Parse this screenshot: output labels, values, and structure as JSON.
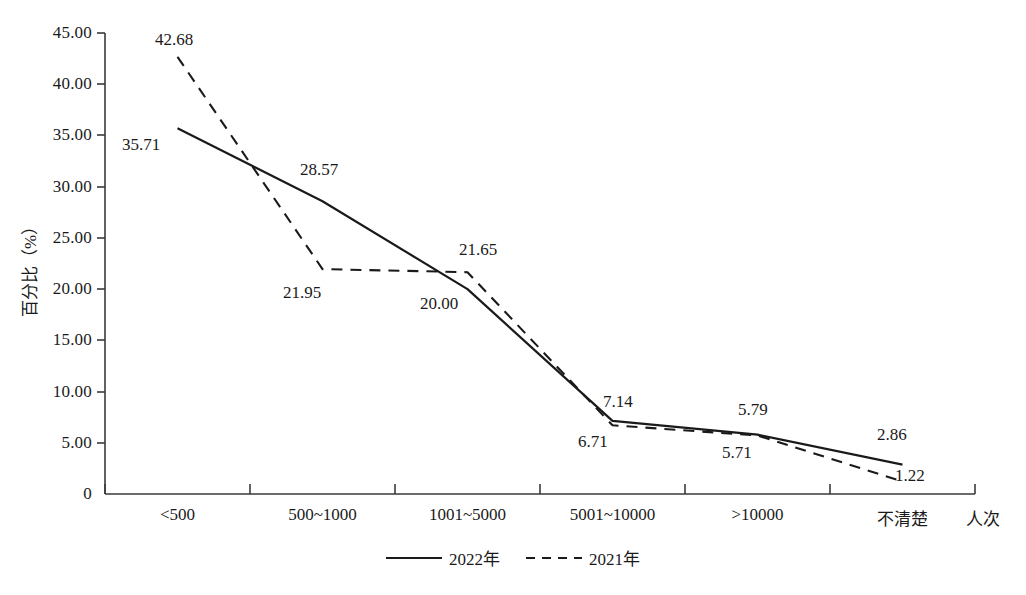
{
  "chart_data": {
    "type": "line",
    "title": "",
    "xlabel": "人次",
    "ylabel": "百分比（%）",
    "categories": [
      "<500",
      "500~1000",
      "1001~5000",
      "5001~10000",
      ">10000",
      "不清楚"
    ],
    "series": [
      {
        "name": "2022年",
        "style": "solid",
        "color": "#1a1a1a",
        "values": [
          35.71,
          28.57,
          20.0,
          7.14,
          5.79,
          2.86
        ],
        "labels": [
          "35.71",
          "28.57",
          "20.00",
          "7.14",
          "5.79",
          "2.86"
        ]
      },
      {
        "name": "2021年",
        "style": "dashed",
        "color": "#1a1a1a",
        "values": [
          42.68,
          21.95,
          21.65,
          6.71,
          5.71,
          1.22
        ],
        "labels": [
          "42.68",
          "21.95",
          "21.65",
          "6.71",
          "5.71",
          "1.22"
        ]
      }
    ],
    "ylim": [
      0,
      45
    ],
    "ytick_values": [
      0,
      5,
      10,
      15,
      20,
      25,
      30,
      35,
      40,
      45
    ],
    "ytick_labels": [
      "0",
      "5.00",
      "10.00",
      "15.00",
      "20.00",
      "25.00",
      "30.00",
      "35.00",
      "40.00",
      "45.00"
    ],
    "grid": false,
    "legend_position": "bottom-center",
    "legend": [
      "2022年",
      "2021年"
    ]
  },
  "axis": {
    "y_title": "百分比（%）",
    "x_unit": "人次"
  },
  "labels": {
    "s2022": {
      "p0": "35.71",
      "p1": "28.57",
      "p2": "20.00",
      "p3": "7.14",
      "p4": "5.79",
      "p5": "2.86"
    },
    "s2021": {
      "p0": "42.68",
      "p1": "21.95",
      "p2": "21.65",
      "p3": "6.71",
      "p4": "5.71",
      "p5": "1.22"
    }
  },
  "yticks": {
    "t0": "0",
    "t5": "5.00",
    "t10": "10.00",
    "t15": "15.00",
    "t20": "20.00",
    "t25": "25.00",
    "t30": "30.00",
    "t35": "35.00",
    "t40": "40.00",
    "t45": "45.00"
  },
  "xticks": {
    "c0": "<500",
    "c1": "500~1000",
    "c2": "1001~5000",
    "c3": "5001~10000",
    "c4": ">10000",
    "c5": "不清楚"
  },
  "legend": {
    "item0": "2022年",
    "item1": "2021年"
  }
}
